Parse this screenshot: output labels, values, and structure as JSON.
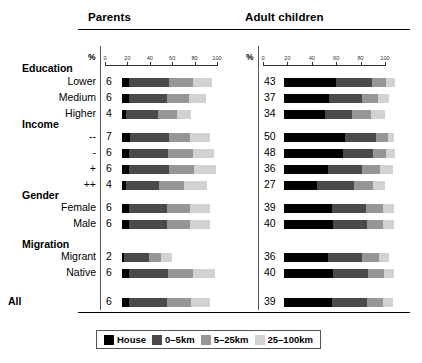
{
  "panels": {
    "parents": {
      "title": "Parents",
      "pct": "%"
    },
    "children": {
      "title": "Adult children",
      "pct": "%"
    }
  },
  "axis": {
    "ticks": [
      0,
      20,
      40,
      60,
      80,
      100
    ],
    "tick_labels": [
      "0",
      "20",
      "40",
      "60",
      "80",
      "100"
    ]
  },
  "legend": {
    "items": [
      {
        "label": "House",
        "color": "#000000"
      },
      {
        "label": "0–5km",
        "color": "#4a4a4a"
      },
      {
        "label": "5–25km",
        "color": "#969696"
      },
      {
        "label": "25–100km",
        "color": "#d2d2d2"
      }
    ]
  },
  "groups": [
    {
      "title": "Education"
    },
    {
      "title": "Income"
    },
    {
      "title": "Gender"
    },
    {
      "title": "Migration"
    },
    {
      "title": "All"
    }
  ],
  "chart_data": {
    "type": "bar",
    "orientation": "horizontal",
    "stacked": true,
    "title": "",
    "xlabel": "%",
    "ylabel": "",
    "xlim": [
      0,
      100
    ],
    "grid": false,
    "legend_position": "bottom",
    "series": [
      {
        "name": "House",
        "color": "#000000"
      },
      {
        "name": "0–5km",
        "color": "#4a4a4a"
      },
      {
        "name": "5–25km",
        "color": "#969696"
      },
      {
        "name": "25–100km",
        "color": "#d2d2d2"
      }
    ],
    "panels": [
      {
        "name": "Parents",
        "rows": [
          {
            "group": "Education",
            "category": "Lower",
            "house": 6,
            "values": [
              6,
              36,
              21,
              17
            ],
            "total": 80
          },
          {
            "group": "Education",
            "category": "Medium",
            "house": 6,
            "values": [
              6,
              34,
              20,
              15
            ],
            "total": 75
          },
          {
            "group": "Education",
            "category": "Higher",
            "house": 4,
            "values": [
              4,
              28,
              17,
              13
            ],
            "total": 62
          },
          {
            "group": "Income",
            "category": "--",
            "house": 7,
            "values": [
              7,
              35,
              19,
              18
            ],
            "total": 79
          },
          {
            "group": "Income",
            "category": "-",
            "house": 6,
            "values": [
              6,
              35,
              22,
              19
            ],
            "total": 82
          },
          {
            "group": "Income",
            "category": "+",
            "house": 6,
            "values": [
              6,
              36,
              22,
              20
            ],
            "total": 84
          },
          {
            "group": "Income",
            "category": "++",
            "house": 4,
            "values": [
              4,
              29,
              22,
              21
            ],
            "total": 76
          },
          {
            "group": "Gender",
            "category": "Female",
            "house": 6,
            "values": [
              6,
              34,
              21,
              18
            ],
            "total": 79
          },
          {
            "group": "Gender",
            "category": "Male",
            "house": 6,
            "values": [
              6,
              34,
              21,
              18
            ],
            "total": 79
          },
          {
            "group": "Migration",
            "category": "Migrant",
            "house": 2,
            "values": [
              2,
              22,
              11,
              10
            ],
            "total": 45
          },
          {
            "group": "Migration",
            "category": "Native",
            "house": 6,
            "values": [
              6,
              35,
              22,
              20
            ],
            "total": 83
          },
          {
            "group": "All",
            "category": "All",
            "house": 6,
            "values": [
              6,
              34,
              22,
              17
            ],
            "total": 79
          }
        ]
      },
      {
        "name": "Adult children",
        "rows": [
          {
            "group": "Education",
            "category": "Lower",
            "house": 43,
            "values": [
              43,
              29,
              12,
              7
            ],
            "total": 91
          },
          {
            "group": "Education",
            "category": "Medium",
            "house": 37,
            "values": [
              37,
              27,
              13,
              9
            ],
            "total": 86
          },
          {
            "group": "Education",
            "category": "Higher",
            "house": 34,
            "values": [
              34,
              22,
              15,
              12
            ],
            "total": 83
          },
          {
            "group": "Income",
            "category": "--",
            "house": 50,
            "values": [
              50,
              25,
              10,
              5
            ],
            "total": 90
          },
          {
            "group": "Income",
            "category": "-",
            "house": 48,
            "values": [
              48,
              25,
              11,
              7
            ],
            "total": 91
          },
          {
            "group": "Income",
            "category": "+",
            "house": 36,
            "values": [
              36,
              28,
              15,
              10
            ],
            "total": 89
          },
          {
            "group": "Income",
            "category": "++",
            "house": 27,
            "values": [
              27,
              30,
              16,
              10
            ],
            "total": 83
          },
          {
            "group": "Gender",
            "category": "Female",
            "house": 39,
            "values": [
              39,
              28,
              14,
              9
            ],
            "total": 90
          },
          {
            "group": "Gender",
            "category": "Male",
            "house": 40,
            "values": [
              40,
              28,
              13,
              9
            ],
            "total": 90
          },
          {
            "group": "Migration",
            "category": "Migrant",
            "house": 36,
            "values": [
              36,
              28,
              14,
              8
            ],
            "total": 86
          },
          {
            "group": "Migration",
            "category": "Native",
            "house": 40,
            "values": [
              40,
              29,
              13,
              8
            ],
            "total": 90
          },
          {
            "group": "All",
            "category": "All",
            "house": 39,
            "values": [
              39,
              29,
              13,
              8
            ],
            "total": 89
          }
        ]
      }
    ]
  }
}
